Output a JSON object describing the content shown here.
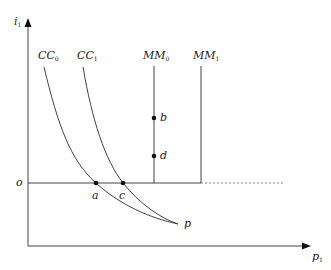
{
  "diagram": {
    "axes": {
      "y_label": "i",
      "y_label_sub": "1",
      "x_label": "p",
      "x_label_sub": "1",
      "origin_label": "o"
    },
    "curves": [
      {
        "id": "CC0",
        "label": "CC",
        "sub": "0"
      },
      {
        "id": "CC1",
        "label": "CC",
        "sub": "1"
      }
    ],
    "vertical_lines": [
      {
        "id": "MM0",
        "label": "MM",
        "sub": "0"
      },
      {
        "id": "MM1",
        "label": "MM",
        "sub": "1"
      }
    ],
    "points": [
      {
        "id": "a",
        "label": "a"
      },
      {
        "id": "b",
        "label": "b"
      },
      {
        "id": "c",
        "label": "c"
      },
      {
        "id": "d",
        "label": "d"
      },
      {
        "id": "p",
        "label": "p"
      }
    ],
    "colors": {
      "line": "#444444",
      "dashed": "#888888",
      "text": "#222222"
    }
  }
}
